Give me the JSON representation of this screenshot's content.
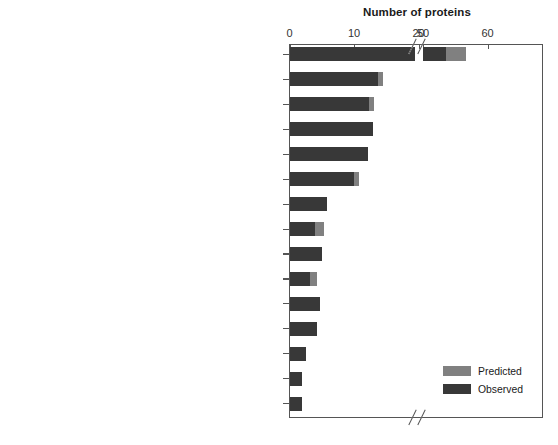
{
  "chart_data": {
    "type": "bar",
    "orientation": "horizontal",
    "title": "Number of proteins",
    "xlabel": "Number of proteins",
    "ylabel": "",
    "grid": false,
    "legend_position": "bottom-right",
    "axis_break": {
      "present": true,
      "between": [
        20,
        50
      ]
    },
    "x_ticks": [
      {
        "label": "0",
        "value": 0
      },
      {
        "label": "10",
        "value": 10
      },
      {
        "label": "20",
        "value": 20
      },
      {
        "label": "50",
        "value": 50
      },
      {
        "label": "60",
        "value": 60
      }
    ],
    "xlim_lower": [
      0,
      22
    ],
    "xlim_upper": [
      48,
      63
    ],
    "categories": [
      "Protein synthesis",
      "Biosynthesis of cofactors, prosthetic groups, and carriers",
      "DNA metabolism",
      "Purines, pyrimidines, nucleosides, and nucleotides",
      "Amino acid biosynthesis",
      "Protein fate",
      "Cell envelope",
      "Hypothetical proteins",
      "Cellular processes",
      "Transcription",
      "Unknown function",
      "Energy metabolism",
      "Fatty acid and phospholipid metabolism",
      "Central intermediary metabolism",
      "Regulatory functions"
    ],
    "series": [
      {
        "name": "Observed",
        "color": "#383838",
        "values": [
          53.5,
          13.7,
          12.3,
          12.9,
          12.1,
          10.0,
          5.8,
          4.0,
          5.1,
          3.2,
          4.8,
          4.3,
          2.5,
          1.9,
          2.0
        ]
      },
      {
        "name": "Predicted",
        "color": "#808080",
        "values": [
          3.2,
          0.8,
          0.8,
          0.0,
          0.0,
          0.8,
          0.0,
          1.4,
          0.0,
          1.1,
          0.0,
          0.0,
          0.0,
          0.0,
          0.0
        ]
      }
    ],
    "legend": [
      {
        "label": "Predicted",
        "color": "#808080"
      },
      {
        "label": "Observed",
        "color": "#383838"
      }
    ]
  }
}
